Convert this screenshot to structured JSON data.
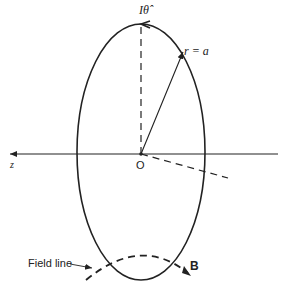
{
  "labels": {
    "current": "Iθ̂",
    "radius": "r = a",
    "axis": "z",
    "origin": "O",
    "field_line": "Field line",
    "field": "B"
  },
  "colors": {
    "stroke": "#222222",
    "background": "#ffffff"
  }
}
